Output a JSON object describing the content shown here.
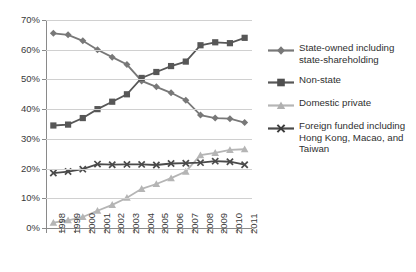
{
  "chart_data": {
    "type": "line",
    "title": "",
    "xlabel": "",
    "ylabel": "",
    "categories": [
      "1998",
      "1999",
      "2000",
      "2001",
      "2002",
      "2003",
      "2004",
      "2005",
      "2006",
      "2007",
      "2008",
      "2009",
      "2010",
      "2011"
    ],
    "ylim": [
      0,
      70
    ],
    "ytick_labels": [
      "0%",
      "10%",
      "20%",
      "30%",
      "40%",
      "50%",
      "60%",
      "70%"
    ],
    "ytick_values": [
      0,
      10,
      20,
      30,
      40,
      50,
      60,
      70
    ],
    "grid": true,
    "legend_position": "right",
    "value_unit": "%",
    "series": [
      {
        "name": "State-owned including state-shareholding",
        "marker": "diamond",
        "color": "#787878",
        "values": [
          65.5,
          65.0,
          63.0,
          60.0,
          57.5,
          55.0,
          49.5,
          47.5,
          45.5,
          43.0,
          38.0,
          37.0,
          36.8,
          35.5
        ]
      },
      {
        "name": "Non-state",
        "marker": "square",
        "color": "#575757",
        "values": [
          34.5,
          34.8,
          37.0,
          40.0,
          42.5,
          45.0,
          50.5,
          52.5,
          54.5,
          56.0,
          61.5,
          62.5,
          62.2,
          64.0
        ]
      },
      {
        "name": "Domestic private",
        "marker": "triangle",
        "color": "#b5b5b5",
        "values": [
          1.8,
          2.6,
          3.7,
          5.8,
          7.8,
          10.2,
          13.2,
          14.8,
          16.8,
          19.0,
          24.5,
          25.3,
          26.3,
          26.5
        ]
      },
      {
        "name": "Foreign funded including Hong Kong, Macao, and Taiwan",
        "marker": "cross",
        "color": "#4a4a4a",
        "values": [
          18.5,
          19.0,
          19.8,
          21.5,
          21.3,
          21.4,
          21.4,
          21.2,
          21.7,
          21.8,
          22.0,
          22.5,
          22.3,
          21.3
        ]
      }
    ]
  },
  "legend": {
    "items": [
      {
        "label": "State-owned including state-shareholding",
        "icon": "diamond-marker-icon"
      },
      {
        "label": "Non-state",
        "icon": "square-marker-icon"
      },
      {
        "label": "Domestic private",
        "icon": "triangle-marker-icon"
      },
      {
        "label": "Foreign funded including Hong Kong, Macao, and Taiwan",
        "icon": "cross-marker-icon"
      }
    ]
  }
}
